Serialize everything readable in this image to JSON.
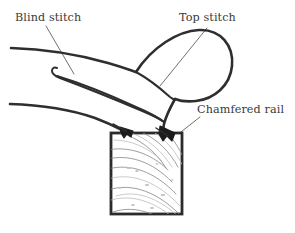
{
  "figure": {
    "background_color": "#ffffff",
    "line_color": "#2e2e2e",
    "leader_color": "#4a4a4a",
    "grain_color": "#8d8d8d",
    "stitch_color": "#1c1c1c",
    "width": 295,
    "height": 233
  },
  "labels": {
    "blind_stitch": "Blind stitch",
    "top_stitch": "Top stitch",
    "chamfered_rail": "Chamfered rail"
  },
  "parts": {
    "rail": "chamfered-rail-block",
    "rolled_edge": "rolled-upholstery-edge",
    "hem_fold": "folded-hem",
    "cover_layer": "cover-fabric-layer",
    "under_layer": "under-fabric-layer",
    "left_stitch": "blind-stitch-point",
    "right_stitch": "top-stitch-point"
  }
}
